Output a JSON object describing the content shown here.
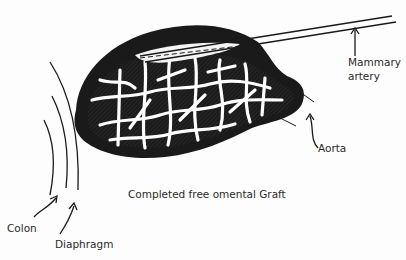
{
  "figure": {
    "caption": "Completed free omental Graft",
    "labels": {
      "mammary_line1": "Mammary",
      "mammary_line2": "artery",
      "aorta": "Aorta",
      "colon": "Colon",
      "diaphragm": "Diaphragm"
    },
    "colors": {
      "ink": "#1a1a1a",
      "background": "#fdfdfd",
      "hatch": "#3a3a3a"
    }
  }
}
